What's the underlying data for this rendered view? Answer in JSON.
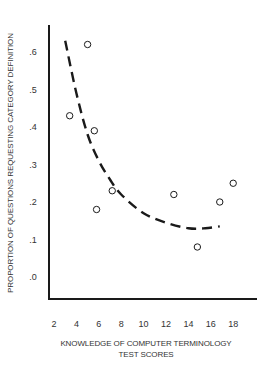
{
  "chart_data": {
    "type": "scatter",
    "title": "",
    "xlabel": "KNOWLEDGE OF COMPUTER TERMINOLOGY TEST SCORES",
    "xlabel_lines": [
      "KNOWLEDGE OF COMPUTER TERMINOLOGY",
      "TEST SCORES"
    ],
    "ylabel": "PROPORTION OF QUESTIONS REQUESTING CATEGORY DEFINITION",
    "x_ticks": [
      2,
      4,
      6,
      8,
      10,
      12,
      14,
      16,
      18
    ],
    "x_tick_labels": [
      "2",
      "4",
      "6",
      "8",
      "10",
      "12",
      "14",
      "16",
      "18"
    ],
    "y_ticks": [
      0.0,
      0.1,
      0.2,
      0.3,
      0.4,
      0.5,
      0.6
    ],
    "y_tick_labels": [
      ".0",
      ".1",
      ".2",
      ".3",
      ".4",
      ".5",
      ".6"
    ],
    "xlim": [
      0.5,
      20.7
    ],
    "ylim": [
      -0.06,
      0.67
    ],
    "grid": false,
    "legend": null,
    "series": [
      {
        "name": "observations",
        "marker": "open-circle",
        "points": [
          {
            "x": 3.4,
            "y": 0.43
          },
          {
            "x": 5.0,
            "y": 0.62
          },
          {
            "x": 5.6,
            "y": 0.39
          },
          {
            "x": 5.8,
            "y": 0.18
          },
          {
            "x": 7.2,
            "y": 0.23
          },
          {
            "x": 12.7,
            "y": 0.22
          },
          {
            "x": 14.8,
            "y": 0.08
          },
          {
            "x": 16.8,
            "y": 0.2
          },
          {
            "x": 18.0,
            "y": 0.25
          }
        ]
      },
      {
        "name": "fitted curve",
        "style": "dashed",
        "points": [
          {
            "x": 3.0,
            "y": 0.63
          },
          {
            "x": 4.0,
            "y": 0.49
          },
          {
            "x": 5.0,
            "y": 0.38
          },
          {
            "x": 6.0,
            "y": 0.31
          },
          {
            "x": 7.0,
            "y": 0.26
          },
          {
            "x": 8.0,
            "y": 0.22
          },
          {
            "x": 10.0,
            "y": 0.17
          },
          {
            "x": 12.0,
            "y": 0.145
          },
          {
            "x": 14.0,
            "y": 0.13
          },
          {
            "x": 15.5,
            "y": 0.13
          },
          {
            "x": 16.8,
            "y": 0.135
          }
        ]
      }
    ]
  },
  "colors": {
    "ink": "#1a1a1a",
    "background": "#ffffff"
  }
}
